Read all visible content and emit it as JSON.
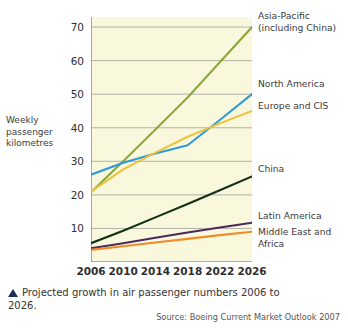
{
  "figure": {
    "axis_title": "Weekly\npassenger\nkilometres",
    "caption": "Projected growth in air passenger numbers 2006 to 2026.",
    "caption_marker": "triangle-marker",
    "source": "Source: Boeing Current Market Outlook 2007"
  },
  "chart_data": {
    "type": "line",
    "title": "",
    "xlabel": "",
    "ylabel": "Weekly passenger kilometres",
    "x": [
      2006,
      2010,
      2014,
      2018,
      2022,
      2026
    ],
    "xlim": [
      2006,
      2026
    ],
    "ylim": [
      0,
      73
    ],
    "yticks": [
      10,
      20,
      30,
      40,
      50,
      60,
      70
    ],
    "xticks": [
      2006,
      2010,
      2014,
      2018,
      2022,
      2026
    ],
    "grid": true,
    "legend_position": "right-inline",
    "background": "#FAF8DC",
    "series": [
      {
        "name": "Asia-Pacific (including China)",
        "label": "Asia-Pacific\n(including China)",
        "color": "#8CA83E",
        "values": [
          20.8,
          30.0,
          39.5,
          49.0,
          59.5,
          70.0
        ]
      },
      {
        "name": "North America",
        "label": "North America",
        "color": "#2E9BD6",
        "values": [
          26.0,
          29.6,
          32.3,
          34.8,
          42.3,
          50.0
        ]
      },
      {
        "name": "Europe and CIS",
        "label": "Europe and CIS",
        "color": "#EFC13D",
        "values": [
          21.0,
          27.6,
          32.6,
          37.3,
          41.3,
          45.0
        ]
      },
      {
        "name": "China",
        "label": "China",
        "color": "#10301A",
        "values": [
          5.6,
          9.3,
          13.3,
          17.3,
          21.4,
          25.5
        ]
      },
      {
        "name": "Latin America",
        "label": "Latin America",
        "color": "#472A5E",
        "values": [
          4.1,
          5.6,
          7.2,
          8.8,
          10.3,
          11.7
        ]
      },
      {
        "name": "Middle East and Africa",
        "label": "Middle East and\nAfrica",
        "color": "#EE8B2B",
        "values": [
          3.6,
          4.7,
          5.8,
          6.9,
          8.0,
          9.0
        ]
      }
    ]
  },
  "series_label_positions": [
    {
      "key": "asia",
      "top": 10
    },
    {
      "key": "north_america",
      "top": 78
    },
    {
      "key": "europe",
      "top": 100
    },
    {
      "key": "china",
      "top": 163
    },
    {
      "key": "latin",
      "top": 210
    },
    {
      "key": "middle_east",
      "top": 226
    }
  ]
}
